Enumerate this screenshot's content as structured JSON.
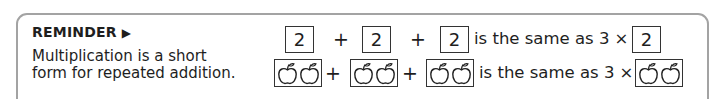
{
  "reminder": {
    "title": "REMINDER",
    "arrow": "▶",
    "line1": "Multiplication is a short",
    "line2": "form for repeated addition."
  },
  "row_numbers": {
    "addends": [
      "2",
      "2",
      "2"
    ],
    "plus": "+",
    "phrase": "is the same as 3 ×",
    "result": "2"
  },
  "row_apples": {
    "addends_count": 3,
    "apples_per_box": 2,
    "icon": "apple-icon",
    "plus": "+",
    "phrase": "is the same as 3 ×"
  },
  "colors": {
    "frame_border": "#a3a3a3",
    "text": "#1e1e1e",
    "box_border": "#333333"
  }
}
